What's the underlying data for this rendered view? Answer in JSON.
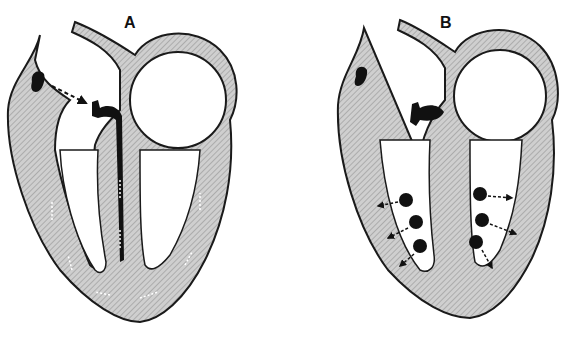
{
  "figure": {
    "panels": [
      {
        "id": "A",
        "label": "A",
        "description": "Heart cross-section showing impulse from SA node to AV node and conduction along bundle branches (dashed arrows)"
      },
      {
        "id": "B",
        "label": "B",
        "description": "Heart cross-section showing Purkinje fiber spread into ventricular myocardium (dots with outward dashed arrows)"
      }
    ],
    "colors": {
      "wall_fill": "#c8c8c8",
      "outline": "#1a1a1a",
      "node": "#111111",
      "background": "#ffffff"
    }
  }
}
